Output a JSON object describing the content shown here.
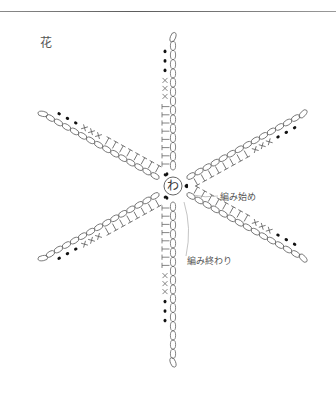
{
  "title": "花",
  "center": {
    "label": "わ",
    "x": 173,
    "y": 186,
    "r": 9
  },
  "labels": {
    "start": "編み始め",
    "end": "編み終わり"
  },
  "legend_symbols": {
    "chain": "oval (chain stitch)",
    "treble": "T (treble/double crochet)",
    "single": "× (single crochet)",
    "slip": "● (slip stitch)"
  },
  "arms": [
    {
      "name": "arm-up",
      "angle": -90,
      "length": 152,
      "side": -1,
      "trebles": 8,
      "singles": 3,
      "dots": 3
    },
    {
      "name": "arm-upper-right",
      "angle": -29,
      "length": 148,
      "side": 1,
      "trebles": 8,
      "singles": 3,
      "dots": 3
    },
    {
      "name": "arm-lower-right",
      "angle": 29,
      "length": 148,
      "side": -1,
      "trebles": 8,
      "singles": 3,
      "dots": 3
    },
    {
      "name": "arm-down",
      "angle": 90,
      "length": 180,
      "side": 1,
      "trebles": 8,
      "singles": 3,
      "dots": 3
    },
    {
      "name": "arm-lower-left",
      "angle": 151,
      "length": 152,
      "side": -1,
      "trebles": 8,
      "singles": 3,
      "dots": 3
    },
    {
      "name": "arm-upper-left",
      "angle": 209,
      "length": 150,
      "side": 1,
      "trebles": 8,
      "singles": 3,
      "dots": 3
    }
  ],
  "colors": {
    "line": "#666666",
    "dot": "#111111",
    "text": "#555555"
  }
}
